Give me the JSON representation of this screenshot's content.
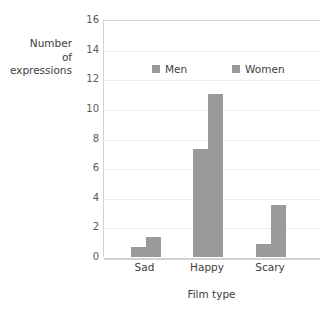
{
  "chart_data": {
    "type": "bar",
    "title": "",
    "subtitle": "",
    "xlabel": "Film type",
    "ylabel": "Number of expressions",
    "ylabel_lines": [
      "Number",
      "of",
      "expressions"
    ],
    "categories": [
      "Sad",
      "Happy",
      "Scary"
    ],
    "series": [
      {
        "name": "Men",
        "values": [
          0.7,
          7.3,
          0.85
        ],
        "color": "#9a9a9a"
      },
      {
        "name": "Women",
        "values": [
          1.35,
          11.0,
          3.5
        ],
        "color": "#9a9a9a"
      }
    ],
    "ylim": [
      0,
      16
    ],
    "yticks": [
      0,
      2,
      4,
      6,
      8,
      10,
      12,
      14,
      16
    ],
    "ytick_labels": [
      "0",
      "2",
      "4",
      "6",
      "8",
      "10",
      "12",
      "14",
      "16"
    ],
    "grid": true,
    "grid_axis": "y",
    "legend": [
      "Men",
      "Women"
    ],
    "legend_position": "inside-upper-center",
    "colors": {
      "bar": "#9a9a9a",
      "gridline": "#ececec",
      "axis": "#d2d2d2",
      "text": "#3d3d3d",
      "tick_text": "#5a5a5a",
      "background": "#ffffff"
    }
  }
}
